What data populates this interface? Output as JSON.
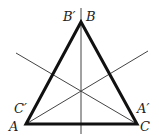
{
  "diagram": {
    "type": "equilateral-triangle-with-symmetry-axes",
    "colors": {
      "triangle": "#111111",
      "axes": "#444444",
      "labels": "#222222",
      "background": "#ffffff"
    },
    "vertices": {
      "A": {
        "x": 26,
        "y": 124
      },
      "B": {
        "x": 81,
        "y": 22
      },
      "C": {
        "x": 137,
        "y": 124
      }
    },
    "axes": [
      {
        "name": "vertical-axis",
        "x1": 81,
        "y1": 8,
        "x2": 81,
        "y2": 134
      },
      {
        "name": "axis-through-C",
        "x1": 137,
        "y1": 124,
        "x2": 16,
        "y2": 53
      },
      {
        "name": "axis-through-A",
        "x1": 26,
        "y1": 124,
        "x2": 148,
        "y2": 51
      }
    ],
    "labels": {
      "B_prime": {
        "text": "B′",
        "x": 63,
        "y": 21
      },
      "B": {
        "text": "B",
        "x": 86,
        "y": 21
      },
      "C_prime": {
        "text": "C′",
        "x": 14,
        "y": 113
      },
      "A": {
        "text": "A",
        "x": 9,
        "y": 131
      },
      "A_prime": {
        "text": "A′",
        "x": 137,
        "y": 113
      },
      "C": {
        "text": "C",
        "x": 140,
        "y": 131
      }
    }
  }
}
